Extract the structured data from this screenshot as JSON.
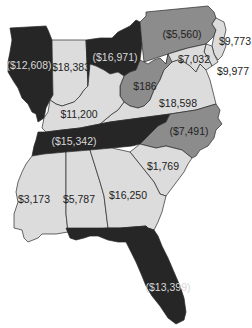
{
  "map": {
    "region": "Eastern United States",
    "colors": {
      "dark": "#262626",
      "medium": "#8c8c8c",
      "light": "#dcdcdc",
      "border": "#2a2a2a",
      "background": "#ffffff"
    },
    "states": [
      {
        "id": "IL",
        "name": "Illinois",
        "value": "($12,608)",
        "shade": "dark"
      },
      {
        "id": "IN",
        "name": "Indiana",
        "value": "$18,383",
        "shade": "light"
      },
      {
        "id": "OH",
        "name": "Ohio",
        "value": "($16,971)",
        "shade": "dark"
      },
      {
        "id": "PA",
        "name": "Pennsylvania",
        "value": "($5,560)",
        "shade": "medium"
      },
      {
        "id": "NJ",
        "name": "New Jersey",
        "value": "$9,773",
        "shade": "light"
      },
      {
        "id": "MD",
        "name": "Maryland",
        "value": "$7,032",
        "shade": "light"
      },
      {
        "id": "DE",
        "name": "Delaware",
        "value": "$9,977",
        "shade": "light"
      },
      {
        "id": "WV",
        "name": "West Virginia",
        "value": "$186",
        "shade": "medium"
      },
      {
        "id": "VA",
        "name": "Virginia",
        "value": "$18,598",
        "shade": "light"
      },
      {
        "id": "KY",
        "name": "Kentucky",
        "value": "$11,200",
        "shade": "light"
      },
      {
        "id": "TN",
        "name": "Tennessee",
        "value": "($15,342)",
        "shade": "dark"
      },
      {
        "id": "NC",
        "name": "North Carolina",
        "value": "($7,491)",
        "shade": "medium"
      },
      {
        "id": "SC",
        "name": "South Carolina",
        "value": "$1,769",
        "shade": "light"
      },
      {
        "id": "MS",
        "name": "Mississippi",
        "value": "$3,173",
        "shade": "light"
      },
      {
        "id": "AL",
        "name": "Alabama",
        "value": "$5,787",
        "shade": "light"
      },
      {
        "id": "GA",
        "name": "Georgia",
        "value": "$16,250",
        "shade": "light"
      },
      {
        "id": "FL",
        "name": "Florida",
        "value": "($13,399)",
        "shade": "dark"
      }
    ]
  }
}
